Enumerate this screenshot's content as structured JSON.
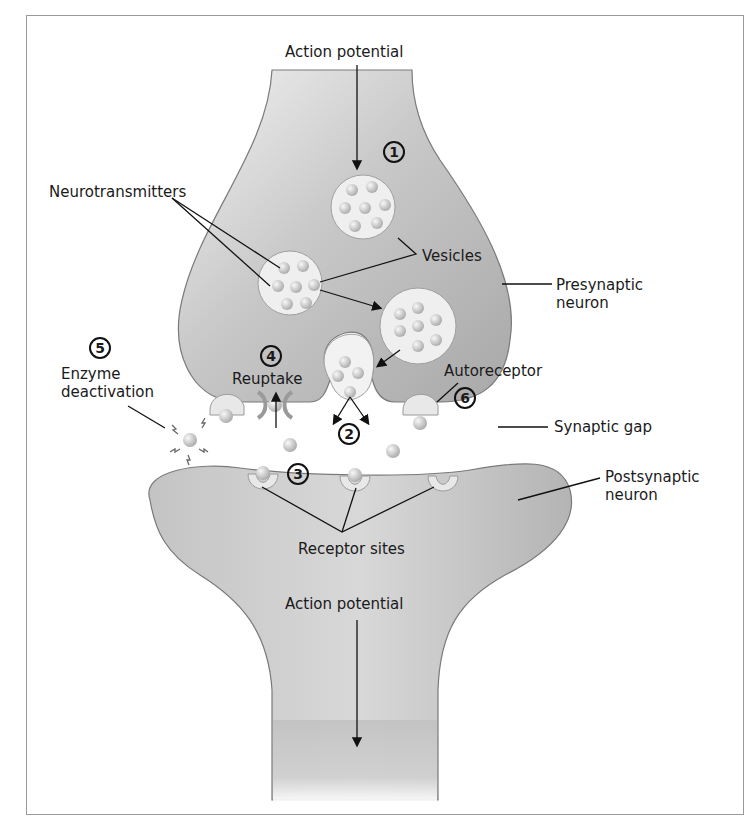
{
  "diagram": {
    "type": "synapse-neurotransmission",
    "colors": {
      "neuron_fill": "#bdbdbd",
      "neuron_fill_light": "#e6e6e6",
      "neuron_outline": "#7a7a7a",
      "vesicle_fill": "#efefef",
      "molecule_fill": "#c9c9c9",
      "frame": "#9a9a9a",
      "text": "#1a1a1a"
    },
    "labels": {
      "action_potential_top": "Action potential",
      "neurotransmitters": "Neurotransmitters",
      "vesicles": "Vesicles",
      "presynaptic_line1": "Presynaptic",
      "presynaptic_line2": "neuron",
      "enzyme_line1": "Enzyme",
      "enzyme_line2": "deactivation",
      "reuptake": "Reuptake",
      "autoreceptor": "Autoreceptor",
      "synaptic_gap": "Synaptic gap",
      "postsynaptic_line1": "Postsynaptic",
      "postsynaptic_line2": "neuron",
      "receptor_sites": "Receptor sites",
      "action_potential_bottom": "Action potential"
    },
    "steps": [
      {
        "id": "1",
        "meaning": "vesicles move toward membrane"
      },
      {
        "id": "2",
        "meaning": "neurotransmitter release"
      },
      {
        "id": "3",
        "meaning": "binding at receptor sites"
      },
      {
        "id": "4",
        "meaning": "reuptake"
      },
      {
        "id": "5",
        "meaning": "enzyme deactivation"
      },
      {
        "id": "6",
        "meaning": "autoreceptor"
      }
    ]
  }
}
